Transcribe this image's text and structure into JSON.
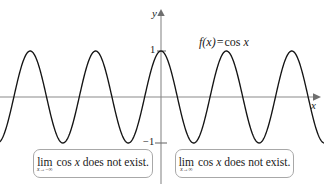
{
  "figure": {
    "background_color": "#ffffff",
    "width": 324,
    "height": 184
  },
  "axes": {
    "x_label": "x",
    "y_label": "y",
    "axis_color": "#8a8a8a",
    "tick_labels": {
      "y_positive_one": "1",
      "y_negative_one": "−1"
    }
  },
  "function_label": {
    "f_of_x": "f(x)",
    "equals": "=",
    "expression": "cos",
    "variable": "x"
  },
  "callouts": [
    {
      "id": "left",
      "lim_operator": "lim",
      "lim_subscript_variable": "x",
      "lim_subscript_arrow": "→",
      "lim_subscript_target": "−∞",
      "body_function": "cos",
      "body_variable": "x",
      "body_statement": "does not exist."
    },
    {
      "id": "right",
      "lim_operator": "lim",
      "lim_subscript_variable": "x",
      "lim_subscript_arrow": "→",
      "lim_subscript_target": "∞",
      "body_function": "cos",
      "body_variable": "x",
      "body_statement": "does not exist."
    }
  ],
  "chart_data": {
    "type": "line",
    "title": "",
    "subtitle": "",
    "xlabel": "x",
    "ylabel": "y",
    "grid": false,
    "legend": null,
    "curve_color": "#141414",
    "curve_width": 1.3,
    "annotations": [
      "f(x) = cos x",
      "lim cos x does not exist. (x → −∞)",
      "lim cos x does not exist. (x → ∞)"
    ],
    "series": [
      {
        "name": "f(x) = cos x",
        "formula": "cos(x)",
        "amplitude": 1,
        "period_units": 6.283185307179586,
        "ylim": [
          -1,
          1
        ],
        "y_ticks": [
          -1,
          1
        ],
        "visible_peaks_x": [
          -12.566,
          -6.283,
          0,
          6.283,
          12.566
        ],
        "visible_troughs_x": [
          -15.708,
          -9.425,
          -3.142,
          3.142,
          9.425,
          15.708
        ]
      }
    ],
    "pixel_geometry": {
      "origin_x": 161,
      "origin_y": 97,
      "amplitude_px": 46,
      "period_px": 65.4,
      "peak_y_px": 51,
      "trough_y_px": 143,
      "peaks_x_px": [
        31,
        96,
        161,
        227,
        292
      ],
      "x_axis_arrow_x_px": 315,
      "y_axis_arrow_y_px": 12
    }
  }
}
